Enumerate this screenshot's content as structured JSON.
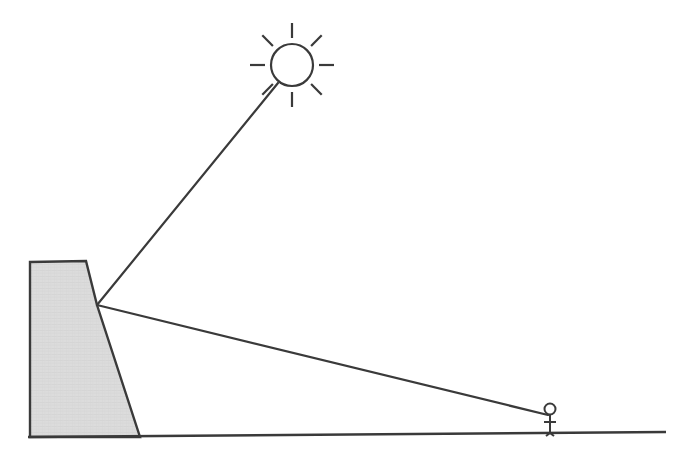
{
  "figure": {
    "type": "line-diagram",
    "canvas": {
      "width": 682,
      "height": 460
    },
    "background_color": "#ffffff",
    "stroke_color": "#3a3a3a",
    "wall_fill_color": "#d9d9d9",
    "wall_texture_color": "#cccccc"
  },
  "elements": {
    "sun": {
      "name": "sun",
      "center_x": 292,
      "center_y": 65,
      "radius": 21,
      "ray_count": 8,
      "ray_inner": 27,
      "ray_outer": 42,
      "stroke_width": 2.2
    },
    "wall": {
      "name": "dam-wall",
      "description": "Trapezoidal dam cross-section",
      "points": "30,262 86,261 97,305 140,437 30,437",
      "top_left": {
        "x": 30,
        "y": 262
      },
      "top_right": {
        "x": 86,
        "y": 261
      },
      "apex": {
        "x": 97,
        "y": 305
      },
      "base_right": {
        "x": 140,
        "y": 437
      },
      "base_left": {
        "x": 30,
        "y": 437
      },
      "stroke_width": 2.4
    },
    "ground": {
      "name": "ground-line",
      "x1": 28,
      "y1": 437,
      "x2": 666,
      "y2": 432,
      "stroke_width": 2.4
    },
    "sight_line": {
      "name": "sight-line-to-sun",
      "description": "Line from dam apex up to the sun",
      "x1": 97,
      "y1": 305,
      "x2": 278,
      "y2": 83,
      "stroke_width": 2.2
    },
    "shadow_line": {
      "name": "shadow-edge-line",
      "description": "Line from dam apex down to the observer",
      "x1": 97,
      "y1": 305,
      "x2": 548,
      "y2": 415,
      "stroke_width": 2.2
    },
    "observer": {
      "name": "observer-figure",
      "description": "Small stick person standing on the ground",
      "head_center_x": 550,
      "head_center_y": 409,
      "head_radius": 5.5,
      "body_x": 550,
      "body_top": 415,
      "body_bottom": 433,
      "arms_y": 422,
      "arms_half_width": 6,
      "leg_spread": 4,
      "stroke_width": 2.0
    }
  }
}
